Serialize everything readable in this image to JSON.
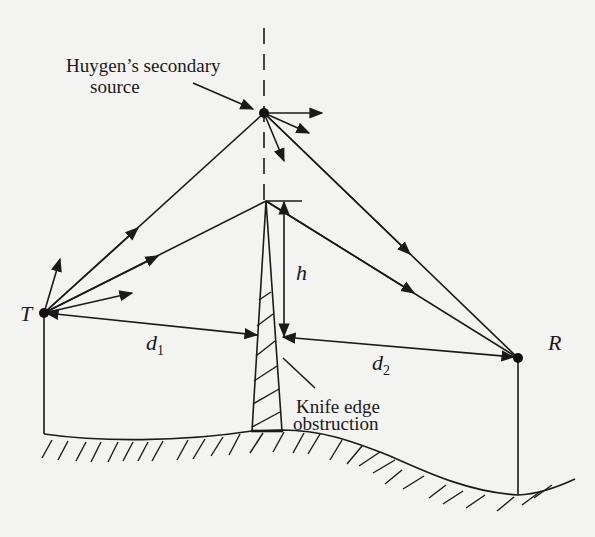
{
  "diagram": {
    "labels": {
      "huygen_line1": "Huygen’s secondary",
      "huygen_line2": "source",
      "transmitter": "T",
      "receiver": "R",
      "height": "h",
      "d1_base": "d",
      "d1_sub": "1",
      "d2_base": "d",
      "d2_sub": "2",
      "knife_line1": "Knife edge",
      "knife_line2": "obstruction"
    },
    "nodes": [
      {
        "id": "T",
        "label": "T",
        "role": "transmitter"
      },
      {
        "id": "R",
        "label": "R",
        "role": "receiver"
      },
      {
        "id": "H",
        "label": "Huygen’s secondary source",
        "role": "secondary source"
      },
      {
        "id": "K",
        "label": "Knife edge obstruction",
        "role": "obstruction"
      }
    ],
    "edges": [
      {
        "from": "T",
        "to": "H",
        "label": "ray"
      },
      {
        "from": "H",
        "to": "R",
        "label": "ray"
      },
      {
        "from": "T",
        "to": "K",
        "label": "ray to knife edge tip"
      },
      {
        "from": "K",
        "to": "R",
        "label": "diffracted ray"
      },
      {
        "from": "T",
        "to": "K",
        "label": "d1"
      },
      {
        "from": "K",
        "to": "R",
        "label": "d2"
      }
    ],
    "colors": {
      "ink": "#1a1a1a",
      "paper": "#f3f3f1"
    }
  }
}
